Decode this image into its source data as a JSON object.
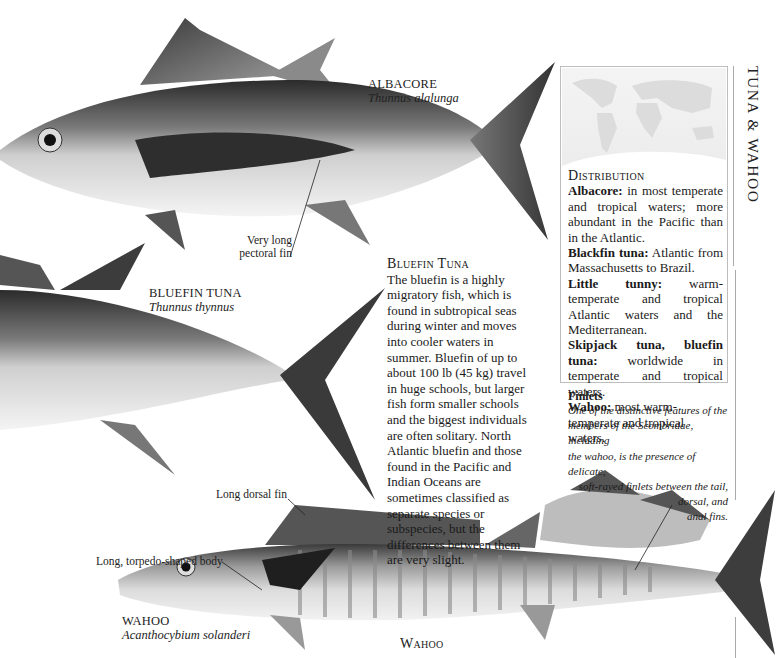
{
  "section_title": "TUNA & WAHOO",
  "species": {
    "albacore": {
      "common_name": "ALBACORE",
      "scientific_name": "Thunnus alalunga",
      "callout": "Very long\npectoral fin"
    },
    "bluefin": {
      "common_name": "BLUEFIN TUNA",
      "scientific_name": "Thunnus thynnus"
    },
    "wahoo": {
      "common_name": "WAHOO",
      "scientific_name": "Acanthocybium solanderi",
      "callouts": {
        "dorsal": "Long dorsal fin",
        "body": "Long, torpedo-shaped body"
      }
    }
  },
  "bluefin_article": {
    "heading": "Bluefin Tuna",
    "body": "The bluefin is a highly migratory fish, which is found in subtropical seas during winter and moves into cooler waters in summer. Bluefin of up to about 100 lb (45 kg) travel in huge schools, but larger fish form smaller schools and the biggest individuals are often solitary. North Atlantic bluefin and those found in the Pacific and Indian Oceans are sometimes classified as separate species or subspecies, but the differences between them are very slight."
  },
  "distribution": {
    "heading": "Distribution",
    "entries": [
      {
        "species": "Albacore:",
        "text": " in most temperate and tropical waters; more abundant in the Pacific than in the Atlantic."
      },
      {
        "species": "Blackfin tuna:",
        "text": " Atlantic from Massachusetts to Brazil."
      },
      {
        "species": "Little tunny:",
        "text": " warm-temperate and tropical Atlantic waters and the Mediterranean."
      },
      {
        "species": "Skipjack tuna, bluefin tuna:",
        "text": " worldwide in temperate and tropical waters."
      },
      {
        "species": "Wahoo:",
        "text": " most warm-temperate and tropical waters."
      }
    ]
  },
  "finlets": {
    "heading": "Finlets",
    "lines": [
      "One of the distinctive features of the",
      "members of the Scombridae, including",
      "the wahoo, is the presence of delicate,",
      "soft-rayed finlets between the tail,",
      "dorsal, and",
      "anal fins."
    ]
  },
  "bottom_heading": "Wahoo",
  "colors": {
    "ink": "#1a1a1a",
    "rule": "#aaaaaa",
    "map": "#e8e8e8"
  }
}
